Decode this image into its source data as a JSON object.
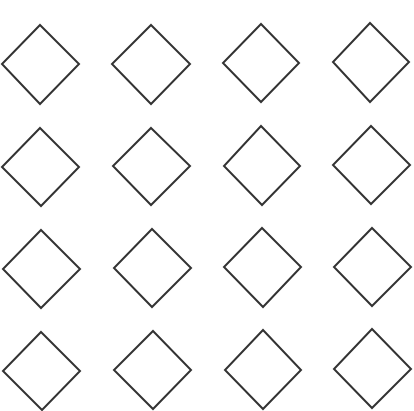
{
  "canvas": {
    "width": 414,
    "height": 411,
    "background": "#ffffff"
  },
  "style": {
    "stroke": "#333333",
    "stroke_width": 2,
    "fill": "none"
  },
  "grid": {
    "rows": 4,
    "cols": 4,
    "shape": "diamond"
  },
  "diamonds": [
    {
      "row": 1,
      "col": 1,
      "top": [
        40,
        25
      ],
      "right": [
        79,
        64
      ],
      "bottom": [
        40,
        104
      ],
      "left": [
        2,
        64
      ]
    },
    {
      "row": 1,
      "col": 2,
      "top": [
        151,
        25
      ],
      "right": [
        190,
        64
      ],
      "bottom": [
        151,
        104
      ],
      "left": [
        112,
        64
      ]
    },
    {
      "row": 1,
      "col": 3,
      "top": [
        261,
        24
      ],
      "right": [
        299,
        63
      ],
      "bottom": [
        261,
        102
      ],
      "left": [
        223,
        63
      ]
    },
    {
      "row": 1,
      "col": 4,
      "top": [
        370,
        23
      ],
      "right": [
        409,
        62
      ],
      "bottom": [
        370,
        102
      ],
      "left": [
        333,
        62
      ]
    },
    {
      "row": 2,
      "col": 1,
      "top": [
        40,
        128
      ],
      "right": [
        79,
        167
      ],
      "bottom": [
        41,
        206
      ],
      "left": [
        2,
        167
      ]
    },
    {
      "row": 2,
      "col": 2,
      "top": [
        151,
        128
      ],
      "right": [
        190,
        166
      ],
      "bottom": [
        151,
        205
      ],
      "left": [
        113,
        166
      ]
    },
    {
      "row": 2,
      "col": 3,
      "top": [
        261,
        126
      ],
      "right": [
        300,
        166
      ],
      "bottom": [
        262,
        205
      ],
      "left": [
        224,
        166
      ]
    },
    {
      "row": 2,
      "col": 4,
      "top": [
        371,
        126
      ],
      "right": [
        410,
        165
      ],
      "bottom": [
        371,
        204
      ],
      "left": [
        333,
        165
      ]
    },
    {
      "row": 3,
      "col": 1,
      "top": [
        41,
        230
      ],
      "right": [
        80,
        269
      ],
      "bottom": [
        41,
        308
      ],
      "left": [
        3,
        269
      ]
    },
    {
      "row": 3,
      "col": 2,
      "top": [
        152,
        229
      ],
      "right": [
        191,
        268
      ],
      "bottom": [
        152,
        307
      ],
      "left": [
        114,
        268
      ]
    },
    {
      "row": 3,
      "col": 3,
      "top": [
        262,
        228
      ],
      "right": [
        301,
        267
      ],
      "bottom": [
        263,
        307
      ],
      "left": [
        224,
        267
      ]
    },
    {
      "row": 3,
      "col": 4,
      "top": [
        372,
        228
      ],
      "right": [
        411,
        267
      ],
      "bottom": [
        372,
        306
      ],
      "left": [
        334,
        267
      ]
    },
    {
      "row": 4,
      "col": 1,
      "top": [
        41,
        332
      ],
      "right": [
        80,
        371
      ],
      "bottom": [
        42,
        410
      ],
      "left": [
        3,
        371
      ]
    },
    {
      "row": 4,
      "col": 2,
      "top": [
        153,
        331
      ],
      "right": [
        191,
        370
      ],
      "bottom": [
        153,
        409
      ],
      "left": [
        114,
        370
      ]
    },
    {
      "row": 4,
      "col": 3,
      "top": [
        263,
        330
      ],
      "right": [
        301,
        370
      ],
      "bottom": [
        263,
        409
      ],
      "left": [
        225,
        370
      ]
    },
    {
      "row": 4,
      "col": 4,
      "top": [
        372,
        329
      ],
      "right": [
        411,
        369
      ],
      "bottom": [
        372,
        408
      ],
      "left": [
        334,
        369
      ]
    }
  ]
}
